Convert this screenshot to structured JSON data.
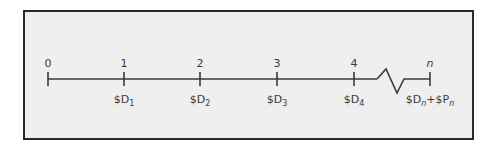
{
  "diagram": {
    "type": "cash-flow-timeline",
    "frame": {
      "background": "#efefef",
      "border": "#2a2a2a"
    },
    "line_color": "#3a3a3a",
    "periods": [
      {
        "label": "0",
        "cash_flow": ""
      },
      {
        "label": "1",
        "cash_flow": "$D",
        "sub": "1"
      },
      {
        "label": "2",
        "cash_flow": "$D",
        "sub": "2"
      },
      {
        "label": "3",
        "cash_flow": "$D",
        "sub": "3"
      },
      {
        "label": "4",
        "cash_flow": "$D",
        "sub": "4"
      },
      {
        "label": "n",
        "cash_flow": "$D",
        "sub": "n",
        "extra": "+$P",
        "extra_sub": "n"
      }
    ],
    "break_symbol": "zigzag"
  }
}
